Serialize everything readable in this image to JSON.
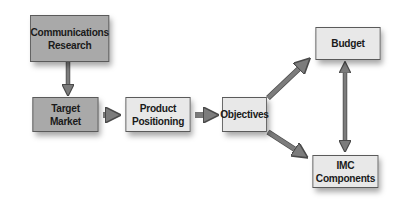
{
  "diagram": {
    "title": "",
    "colors": {
      "dark_box_fill": "#a9a9a9",
      "light_box_fill": "#e8e8e8",
      "box_border": "#5a5a5a",
      "arrow_fill": "#7c7c7c",
      "arrow_stroke": "#4a4a4a",
      "text": "#1a1a1a"
    },
    "nodes": [
      {
        "id": "communications-research",
        "label": "Communications\nResearch",
        "style": "dark"
      },
      {
        "id": "target-market",
        "label": "Target\nMarket",
        "style": "dark"
      },
      {
        "id": "product-positioning",
        "label": "Product\nPositioning",
        "style": "light"
      },
      {
        "id": "objectives",
        "label": "Objectives",
        "style": "light"
      },
      {
        "id": "budget",
        "label": "Budget",
        "style": "light"
      },
      {
        "id": "imc-components",
        "label": "IMC\nComponents",
        "style": "light"
      }
    ],
    "edges": [
      {
        "from": "communications-research",
        "to": "target-market",
        "direction": "one-way"
      },
      {
        "from": "target-market",
        "to": "product-positioning",
        "direction": "one-way"
      },
      {
        "from": "product-positioning",
        "to": "objectives",
        "direction": "one-way"
      },
      {
        "from": "objectives",
        "to": "budget",
        "direction": "one-way"
      },
      {
        "from": "objectives",
        "to": "imc-components",
        "direction": "one-way"
      },
      {
        "from": "budget",
        "to": "imc-components",
        "direction": "two-way"
      }
    ]
  }
}
